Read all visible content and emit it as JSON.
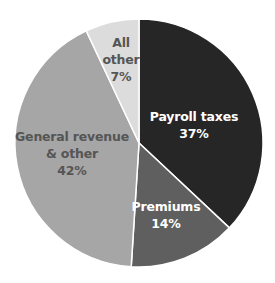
{
  "chart_data": {
    "type": "pie",
    "title": "",
    "start_angle_deg": 0,
    "direction": "clockwise",
    "slices": [
      {
        "name": "Payroll taxes",
        "label_lines": [
          "Payroll taxes",
          "37%"
        ],
        "value": 37,
        "color": "#262626",
        "text_color": "#ffffff"
      },
      {
        "name": "Premiums",
        "label_lines": [
          "Premiums",
          "14%"
        ],
        "value": 14,
        "color": "#5f5f5f",
        "text_color": "#ffffff"
      },
      {
        "name": "General revenue & other",
        "label_lines": [
          "General revenue",
          "& other",
          "42%"
        ],
        "value": 42,
        "color": "#a6a6a6",
        "text_color": "#555555"
      },
      {
        "name": "All other",
        "label_lines": [
          "All",
          "other",
          "7%"
        ],
        "value": 7,
        "color": "#dcdcdc",
        "text_color": "#555555"
      }
    ],
    "legend": "none",
    "separator_color": "#ffffff"
  }
}
